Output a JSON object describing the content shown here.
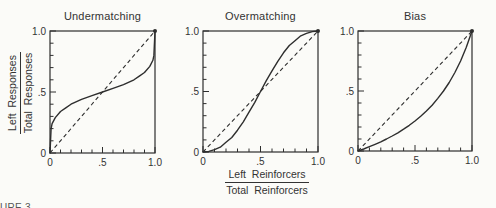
{
  "figure": {
    "background_color": "#fbfbf8",
    "ink_color": "#2e2e2e",
    "caption_fragment": "URE 3.",
    "shared_y_label": {
      "numerator": "Left  Responses",
      "denominator": "Total  Responses"
    },
    "shared_x_label": {
      "numerator": "Left  Reinforcers",
      "denominator": "Total  Reinforcers"
    }
  },
  "chart_data": [
    {
      "type": "line",
      "title": "Undermatching",
      "xlabel": "Left Reinforcers / Total Reinforcers",
      "ylabel": "Left Responses / Total Responses",
      "xlim": [
        0,
        1
      ],
      "ylim": [
        0,
        1
      ],
      "grid": false,
      "frame": "box",
      "x_ticks": {
        "major_values": [
          0,
          0.5,
          1
        ],
        "major_labels": [
          "0",
          ".5",
          "1.0"
        ],
        "minor_step": 0.1
      },
      "y_ticks": {
        "major_values": [
          0,
          0.5,
          1
        ],
        "major_labels": [
          "0",
          ".5",
          "1.0"
        ],
        "minor_step": 0.1
      },
      "identity_line": {
        "style": "dashed",
        "points": [
          [
            0,
            0
          ],
          [
            1,
            1
          ]
        ]
      },
      "endpoint_marker": [
        1,
        1
      ],
      "series": [
        {
          "name": "undermatching-curve",
          "style": "solid",
          "points": [
            [
              0,
              0
            ],
            [
              0.01,
              0.2
            ],
            [
              0.02,
              0.24
            ],
            [
              0.05,
              0.29
            ],
            [
              0.1,
              0.34
            ],
            [
              0.15,
              0.37
            ],
            [
              0.2,
              0.4
            ],
            [
              0.3,
              0.44
            ],
            [
              0.4,
              0.47
            ],
            [
              0.5,
              0.5
            ],
            [
              0.6,
              0.53
            ],
            [
              0.7,
              0.56
            ],
            [
              0.8,
              0.6
            ],
            [
              0.85,
              0.63
            ],
            [
              0.9,
              0.66
            ],
            [
              0.95,
              0.71
            ],
            [
              0.98,
              0.76
            ],
            [
              0.99,
              0.8
            ],
            [
              1,
              1
            ]
          ]
        }
      ]
    },
    {
      "type": "line",
      "title": "Overmatching",
      "xlabel": "Left Reinforcers / Total Reinforcers",
      "ylabel": "Left Responses / Total Responses",
      "xlim": [
        0,
        1
      ],
      "ylim": [
        0,
        1
      ],
      "grid": false,
      "frame": "box",
      "x_ticks": {
        "major_values": [
          0,
          0.5,
          1
        ],
        "major_labels": [
          "0",
          ".5",
          "1.0"
        ],
        "minor_step": 0.1
      },
      "y_ticks": {
        "major_values": [
          0,
          0.5,
          1
        ],
        "major_labels": [
          "0",
          ".5",
          "1.0"
        ],
        "minor_step": 0.1
      },
      "identity_line": {
        "style": "dashed",
        "points": [
          [
            0,
            0
          ],
          [
            1,
            1
          ]
        ]
      },
      "endpoint_marker": [
        1,
        1
      ],
      "series": [
        {
          "name": "overmatching-curve",
          "style": "solid",
          "points": [
            [
              0,
              0
            ],
            [
              0.05,
              0.005
            ],
            [
              0.1,
              0.02
            ],
            [
              0.15,
              0.04
            ],
            [
              0.2,
              0.08
            ],
            [
              0.25,
              0.12
            ],
            [
              0.3,
              0.18
            ],
            [
              0.35,
              0.25
            ],
            [
              0.4,
              0.33
            ],
            [
              0.45,
              0.41
            ],
            [
              0.5,
              0.5
            ],
            [
              0.55,
              0.59
            ],
            [
              0.6,
              0.67
            ],
            [
              0.65,
              0.75
            ],
            [
              0.7,
              0.82
            ],
            [
              0.75,
              0.88
            ],
            [
              0.8,
              0.92
            ],
            [
              0.85,
              0.96
            ],
            [
              0.9,
              0.98
            ],
            [
              0.95,
              0.995
            ],
            [
              1,
              1
            ]
          ]
        }
      ]
    },
    {
      "type": "line",
      "title": "Bias",
      "xlabel": "Left Reinforcers / Total Reinforcers",
      "ylabel": "Left Responses / Total Responses",
      "xlim": [
        0,
        1
      ],
      "ylim": [
        0,
        1
      ],
      "grid": false,
      "frame": "box",
      "x_ticks": {
        "major_values": [
          0,
          0.5,
          1
        ],
        "major_labels": [
          "0",
          ".5",
          "1.0"
        ],
        "minor_step": 0.1
      },
      "y_ticks": {
        "major_values": [
          0,
          0.5,
          1
        ],
        "major_labels": [
          "0",
          ".5",
          "1.0"
        ],
        "minor_step": 0.1
      },
      "identity_line": {
        "style": "dashed",
        "points": [
          [
            0,
            0
          ],
          [
            1,
            1
          ]
        ]
      },
      "endpoint_marker": [
        1,
        1
      ],
      "series": [
        {
          "name": "bias-curve",
          "style": "solid",
          "points": [
            [
              0,
              0
            ],
            [
              0.05,
              0.017
            ],
            [
              0.1,
              0.036
            ],
            [
              0.15,
              0.056
            ],
            [
              0.2,
              0.077
            ],
            [
              0.25,
              0.1
            ],
            [
              0.3,
              0.125
            ],
            [
              0.35,
              0.152
            ],
            [
              0.4,
              0.182
            ],
            [
              0.45,
              0.214
            ],
            [
              0.5,
              0.25
            ],
            [
              0.55,
              0.289
            ],
            [
              0.6,
              0.333
            ],
            [
              0.65,
              0.382
            ],
            [
              0.7,
              0.438
            ],
            [
              0.75,
              0.5
            ],
            [
              0.8,
              0.571
            ],
            [
              0.85,
              0.654
            ],
            [
              0.9,
              0.75
            ],
            [
              0.95,
              0.864
            ],
            [
              1,
              1
            ]
          ]
        }
      ]
    }
  ]
}
